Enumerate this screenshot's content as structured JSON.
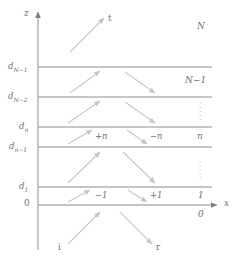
{
  "figure": {
    "type": "multilayer-wave-propagation-diagram",
    "background_color": "#ffffff",
    "line_color": "#8c8c8c",
    "arrow_color": "#b9b9b9",
    "text_color": "#6f6f6f"
  },
  "axes": {
    "z_label": "z",
    "x_label": "x",
    "origin_label": "0"
  },
  "interfaces": [
    {
      "id": "d_N_minus_1",
      "base": "d",
      "sub": "N−1",
      "y": 67
    },
    {
      "id": "d_N_minus_2",
      "base": "d",
      "sub": "N−2",
      "y": 97
    },
    {
      "id": "d_n",
      "base": "d",
      "sub": "n",
      "y": 127
    },
    {
      "id": "d_n_minus_1",
      "base": "d",
      "sub": "n−1",
      "y": 147
    },
    {
      "id": "d_1",
      "base": "d",
      "sub": "1",
      "y": 187
    },
    {
      "id": "x_axis",
      "base": "0",
      "sub": "",
      "y": 205
    }
  ],
  "regions": [
    {
      "id": "region-N",
      "label": "N",
      "y": 28
    },
    {
      "id": "region-N-1",
      "label": "N−1",
      "y": 82
    },
    {
      "id": "region-dots-up",
      "label": "⋮",
      "y": 110
    },
    {
      "id": "region-n",
      "label": "n",
      "y": 137
    },
    {
      "id": "region-dots-lo",
      "label": "⋮",
      "y": 168
    },
    {
      "id": "region-1",
      "label": "1",
      "y": 196
    },
    {
      "id": "region-0",
      "label": "0",
      "y": 215
    }
  ],
  "wave_labels": [
    {
      "id": "plus-n",
      "label": "+n",
      "x": 97,
      "y": 137
    },
    {
      "id": "minus-n",
      "label": "−n",
      "x": 150,
      "y": 137
    },
    {
      "id": "minus-1",
      "label": "−1",
      "x": 97,
      "y": 196
    },
    {
      "id": "plus-1",
      "label": "+1",
      "x": 150,
      "y": 196
    }
  ],
  "rays": [
    {
      "id": "transmitted",
      "label": "t",
      "direction": "up-right"
    },
    {
      "id": "incident",
      "label": "i",
      "direction": "up-right"
    },
    {
      "id": "reflected",
      "label": "r",
      "direction": "down-right"
    }
  ]
}
